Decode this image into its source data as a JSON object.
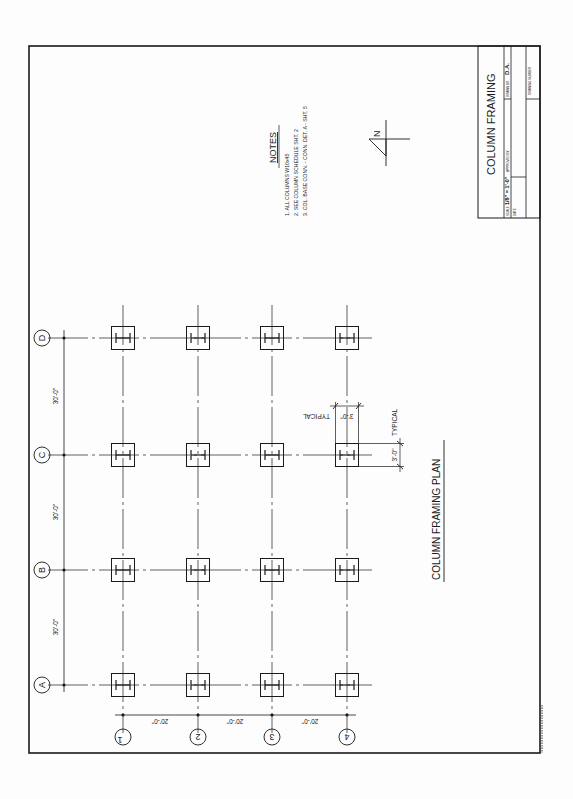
{
  "sheet": {
    "title": "COLUMN FRAMING PLAN",
    "drawing_title": "COLUMN FRAMING",
    "orientation": "rotated 90deg counter-clockwise"
  },
  "title_block": {
    "title": "COLUMN FRAMING",
    "scale_label": "SCALE",
    "scale_value": "1/8\" = 1'-0\"",
    "approved_by_label": "APPROVED BY",
    "drawn_by_label": "DRAWN BY",
    "drawn_by_value": "D.A.",
    "date_label": "DATE",
    "drawing_number_label": "DRAWING NUMBER"
  },
  "notes": {
    "heading": "NOTES",
    "items": [
      "1. ALL COLUMNS W10x45",
      "2. SEE COLUMN SCHEDULE SHT. 2",
      "3. COL. BASE CONN. - CONN. DET. A - SHT. 5"
    ]
  },
  "north_arrow": {
    "label": "N"
  },
  "grid": {
    "letters": [
      "A",
      "B",
      "C",
      "D"
    ],
    "numbers": [
      "1",
      "2",
      "3",
      "4"
    ],
    "letter_spacing_labels": [
      "30'-0\"",
      "30'-0\"",
      "30'-0\""
    ],
    "number_spacing_labels": [
      "20'-0\"",
      "20'-0\"",
      "20'-0\""
    ]
  },
  "typical_dimension": {
    "value_1": "3'-0\"",
    "label_1": "TYPICAL",
    "value_2": "3'-0\"",
    "label_2": "TYPICAL"
  },
  "plan_label": "COLUMN FRAMING PLAN"
}
